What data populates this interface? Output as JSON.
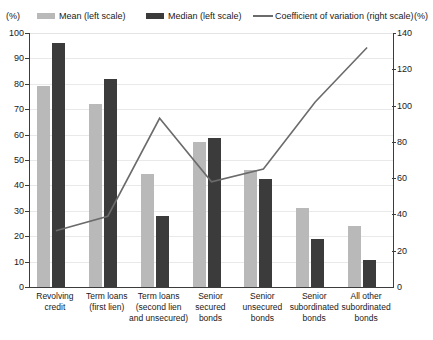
{
  "legend": {
    "unit_left": "(%)",
    "unit_right": "(%)",
    "entries": [
      {
        "label": "Mean (left scale)",
        "marker": "bar-swatch-light",
        "color": "#b9b9b9"
      },
      {
        "label": "Median  (left scale)",
        "marker": "bar-swatch-dark",
        "color": "#3b3b3b"
      },
      {
        "label": "Coefficient of variation (right scale)",
        "marker": "line-swatch",
        "color": "#6b6b6b"
      }
    ]
  },
  "axes": {
    "left_ticks": [
      "100",
      "90",
      "80",
      "70",
      "60",
      "50",
      "40",
      "30",
      "20",
      "10",
      "0"
    ],
    "right_ticks": [
      "140",
      "120",
      "100",
      "80",
      "60",
      "40",
      "20",
      "0"
    ]
  },
  "chart_data": {
    "type": "bar",
    "title": "",
    "xlabel": "",
    "ylabel": "(%)",
    "y2label": "(%)",
    "ylim": [
      0,
      100
    ],
    "y2lim": [
      0,
      140
    ],
    "grid": true,
    "legend_position": "top",
    "categories": [
      "Revolving credit",
      "Term loans (first lien)",
      "Term loans (second lien and unsecured)",
      "Senior secured bonds",
      "Senior unsecured bonds",
      "Senior subordinated bonds",
      "All other subordinated bonds"
    ],
    "category_lines": [
      [
        "Revolving",
        "credit"
      ],
      [
        "Term loans",
        "(first lien)"
      ],
      [
        "Term loans",
        "(second lien",
        "and unsecured)"
      ],
      [
        "Senior",
        "secured",
        "bonds"
      ],
      [
        "Senior",
        "unsecured",
        "bonds"
      ],
      [
        "Senior",
        "subordinated",
        "bonds"
      ],
      [
        "All other",
        "subordinated",
        "bonds"
      ]
    ],
    "series": [
      {
        "name": "Mean (left scale)",
        "type": "bar",
        "axis": "left",
        "color": "#b9b9b9",
        "values": [
          79,
          72,
          44.5,
          57,
          46,
          31,
          24
        ]
      },
      {
        "name": "Median  (left scale)",
        "type": "bar",
        "axis": "left",
        "color": "#3b3b3b",
        "values": [
          96,
          82,
          28,
          58.5,
          42.5,
          19,
          10.5
        ]
      },
      {
        "name": "Coefficient of variation (right scale)",
        "type": "line",
        "axis": "right",
        "color": "#6b6b6b",
        "values": [
          31,
          39,
          93,
          58,
          65,
          102,
          132
        ]
      }
    ]
  }
}
